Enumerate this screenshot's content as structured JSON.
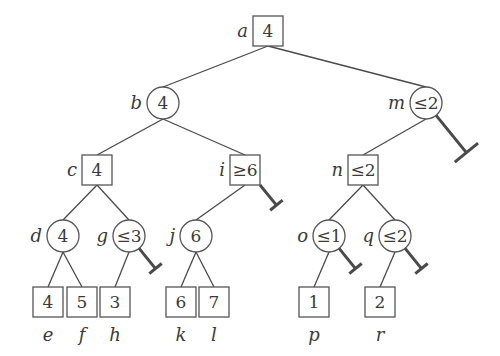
{
  "diagram": {
    "title": "",
    "colors": {
      "stroke": "#555555",
      "text": "#3a3a3a",
      "background": "#ffffff"
    },
    "nodes": [
      {
        "id": "a",
        "shape": "square",
        "value": "4",
        "x": 268,
        "y": 31,
        "label_pos": "left"
      },
      {
        "id": "b",
        "shape": "circle",
        "value": "4",
        "x": 163,
        "y": 103,
        "label_pos": "left"
      },
      {
        "id": "m",
        "shape": "circle",
        "value": "≤2",
        "x": 426,
        "y": 103,
        "label_pos": "left"
      },
      {
        "id": "c",
        "shape": "square",
        "value": "4",
        "x": 97,
        "y": 170,
        "label_pos": "left"
      },
      {
        "id": "i",
        "shape": "square",
        "value": "≥6",
        "x": 245,
        "y": 170,
        "label_pos": "left"
      },
      {
        "id": "n",
        "shape": "square",
        "value": "≤2",
        "x": 363,
        "y": 170,
        "label_pos": "left"
      },
      {
        "id": "d",
        "shape": "circle",
        "value": "4",
        "x": 63,
        "y": 236,
        "label_pos": "left"
      },
      {
        "id": "g",
        "shape": "circle",
        "value": "≤3",
        "x": 129,
        "y": 236,
        "label_pos": "left"
      },
      {
        "id": "j",
        "shape": "circle",
        "value": "6",
        "x": 196,
        "y": 236,
        "label_pos": "left"
      },
      {
        "id": "o",
        "shape": "circle",
        "value": "≤1",
        "x": 329,
        "y": 236,
        "label_pos": "left"
      },
      {
        "id": "q",
        "shape": "circle",
        "value": "≤2",
        "x": 395,
        "y": 236,
        "label_pos": "left"
      },
      {
        "id": "e",
        "shape": "square",
        "value": "4",
        "x": 48,
        "y": 302,
        "label_pos": "below"
      },
      {
        "id": "f",
        "shape": "square",
        "value": "5",
        "x": 82,
        "y": 302,
        "label_pos": "below"
      },
      {
        "id": "h",
        "shape": "square",
        "value": "3",
        "x": 115,
        "y": 302,
        "label_pos": "below"
      },
      {
        "id": "k",
        "shape": "square",
        "value": "6",
        "x": 181,
        "y": 302,
        "label_pos": "below"
      },
      {
        "id": "l",
        "shape": "square",
        "value": "7",
        "x": 214,
        "y": 302,
        "label_pos": "below"
      },
      {
        "id": "p",
        "shape": "square",
        "value": "1",
        "x": 314,
        "y": 302,
        "label_pos": "below"
      },
      {
        "id": "r",
        "shape": "square",
        "value": "2",
        "x": 380,
        "y": 302,
        "label_pos": "below"
      }
    ],
    "edges": [
      [
        "a",
        "b"
      ],
      [
        "a",
        "m"
      ],
      [
        "b",
        "c"
      ],
      [
        "b",
        "i"
      ],
      [
        "m",
        "n"
      ],
      [
        "c",
        "d"
      ],
      [
        "c",
        "g"
      ],
      [
        "i",
        "j"
      ],
      [
        "n",
        "o"
      ],
      [
        "n",
        "q"
      ],
      [
        "d",
        "e"
      ],
      [
        "d",
        "f"
      ],
      [
        "g",
        "h"
      ],
      [
        "j",
        "k"
      ],
      [
        "j",
        "l"
      ],
      [
        "o",
        "p"
      ],
      [
        "q",
        "r"
      ]
    ],
    "pruned": [
      {
        "from": "m",
        "length": 48,
        "bar": 30
      },
      {
        "from": "i",
        "length": 26,
        "bar": 16
      },
      {
        "from": "g",
        "length": 26,
        "bar": 16
      },
      {
        "from": "o",
        "length": 26,
        "bar": 16
      },
      {
        "from": "q",
        "length": 26,
        "bar": 16
      }
    ]
  }
}
